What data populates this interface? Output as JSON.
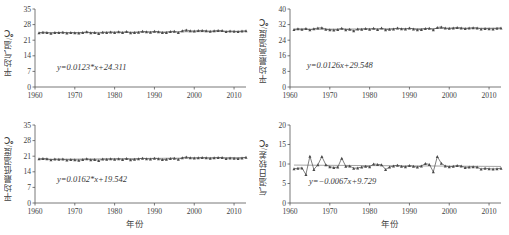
{
  "figure": {
    "xlabel": "年份",
    "x_tick_labels": [
      "1960",
      "1970",
      "1980",
      "1990",
      "2000",
      "2010"
    ],
    "x_ticks": [
      1960,
      1970,
      1980,
      1990,
      2000,
      2010
    ],
    "marker": "triangle",
    "line_color": "#555555",
    "marker_color": "#4a4a4a",
    "axis_color": "#555555"
  },
  "chart_data": [
    {
      "id": "mean-temperature",
      "type": "line",
      "position": "top-left",
      "title": "",
      "xlabel": "",
      "ylabel": "平均气温/℃",
      "annotation": "y=0.0123*x+24.311",
      "trend_slope": 0.0123,
      "trend_intercept": 24.311,
      "trend_significant": true,
      "xlim": [
        1960,
        2013
      ],
      "ylim": [
        0,
        35
      ],
      "yticks": [
        0,
        7,
        14,
        21,
        28,
        35
      ],
      "grid": false,
      "legend": "none",
      "x": [
        1961,
        1962,
        1963,
        1964,
        1965,
        1966,
        1967,
        1968,
        1969,
        1970,
        1971,
        1972,
        1973,
        1974,
        1975,
        1976,
        1977,
        1978,
        1979,
        1980,
        1981,
        1982,
        1983,
        1984,
        1985,
        1986,
        1987,
        1988,
        1989,
        1990,
        1991,
        1992,
        1993,
        1994,
        1995,
        1996,
        1997,
        1998,
        1999,
        2000,
        2001,
        2002,
        2003,
        2004,
        2005,
        2006,
        2007,
        2008,
        2009,
        2010,
        2011,
        2012,
        2013
      ],
      "values": [
        24.3,
        24.6,
        24.5,
        24.1,
        24.5,
        24.4,
        24.6,
        24.2,
        24.4,
        24.3,
        24.2,
        24.4,
        24.8,
        24.3,
        24.4,
        24.0,
        24.6,
        24.5,
        24.7,
        24.5,
        24.8,
        24.4,
        24.9,
        24.3,
        24.5,
        24.6,
        25.0,
        24.8,
        24.6,
        25.0,
        24.8,
        24.4,
        24.5,
        24.9,
        25.0,
        24.5,
        25.2,
        25.6,
        25.2,
        25.1,
        25.3,
        25.4,
        25.2,
        25.0,
        25.2,
        25.4,
        25.3,
        24.9,
        25.1,
        25.0,
        24.9,
        25.1,
        25.2
      ]
    },
    {
      "id": "mean-maximum-temperature",
      "type": "line",
      "position": "top-right",
      "title": "",
      "xlabel": "",
      "ylabel": "平均最高温度/℃",
      "annotation": "y=0.0126x+29.548",
      "trend_slope": 0.0126,
      "trend_intercept": 29.548,
      "trend_significant": false,
      "xlim": [
        1960,
        2013
      ],
      "ylim": [
        0,
        40
      ],
      "yticks": [
        0,
        8,
        16,
        24,
        32,
        40
      ],
      "grid": false,
      "legend": "none",
      "x": [
        1961,
        1962,
        1963,
        1964,
        1965,
        1966,
        1967,
        1968,
        1969,
        1970,
        1971,
        1972,
        1973,
        1974,
        1975,
        1976,
        1977,
        1978,
        1979,
        1980,
        1981,
        1982,
        1983,
        1984,
        1985,
        1986,
        1987,
        1988,
        1989,
        1990,
        1991,
        1992,
        1993,
        1994,
        1995,
        1996,
        1997,
        1998,
        1999,
        2000,
        2001,
        2002,
        2003,
        2004,
        2005,
        2006,
        2007,
        2008,
        2009,
        2010,
        2011,
        2012,
        2013
      ],
      "values": [
        29.5,
        29.9,
        29.6,
        30.0,
        29.3,
        29.9,
        30.2,
        30.4,
        29.6,
        29.4,
        29.2,
        29.5,
        30.1,
        29.4,
        29.6,
        28.9,
        29.7,
        29.6,
        30.0,
        29.6,
        30.1,
        29.5,
        30.2,
        29.4,
        29.6,
        29.8,
        30.2,
        29.9,
        29.7,
        30.2,
        29.8,
        29.4,
        29.5,
        30.0,
        30.1,
        29.4,
        30.5,
        30.8,
        30.2,
        30.1,
        30.3,
        30.5,
        30.3,
        30.0,
        30.2,
        30.4,
        30.3,
        29.8,
        30.0,
        29.9,
        29.8,
        30.1,
        30.2
      ]
    },
    {
      "id": "mean-minimum-temperature",
      "type": "line",
      "position": "bottom-left",
      "title": "",
      "xlabel": "年份",
      "ylabel": "平均最低温度/℃",
      "annotation": "y=0.0162*x+19.542",
      "trend_slope": 0.0162,
      "trend_intercept": 19.542,
      "trend_significant": true,
      "xlim": [
        1960,
        2013
      ],
      "ylim": [
        0,
        35
      ],
      "yticks": [
        0,
        7,
        14,
        21,
        28,
        35
      ],
      "grid": false,
      "legend": "none",
      "x": [
        1961,
        1962,
        1963,
        1964,
        1965,
        1966,
        1967,
        1968,
        1969,
        1970,
        1971,
        1972,
        1973,
        1974,
        1975,
        1976,
        1977,
        1978,
        1979,
        1980,
        1981,
        1982,
        1983,
        1984,
        1985,
        1986,
        1987,
        1988,
        1989,
        1990,
        1991,
        1992,
        1993,
        1994,
        1995,
        1996,
        1997,
        1998,
        1999,
        2000,
        2001,
        2002,
        2003,
        2004,
        2005,
        2006,
        2007,
        2008,
        2009,
        2010,
        2011,
        2012,
        2013
      ],
      "values": [
        19.8,
        20.0,
        19.9,
        19.4,
        19.7,
        19.6,
        19.7,
        19.3,
        19.5,
        19.4,
        19.2,
        19.5,
        19.8,
        19.4,
        19.5,
        19.1,
        19.7,
        19.6,
        19.8,
        19.6,
        19.9,
        19.5,
        20.0,
        19.4,
        19.6,
        19.8,
        20.1,
        19.9,
        19.7,
        20.1,
        19.9,
        19.5,
        19.6,
        20.0,
        20.1,
        19.6,
        20.3,
        20.6,
        20.3,
        20.2,
        20.3,
        20.4,
        20.3,
        20.1,
        20.3,
        20.4,
        20.4,
        20.0,
        20.2,
        20.1,
        20.0,
        20.2,
        20.5
      ]
    },
    {
      "id": "diurnal-temperature-range",
      "type": "line",
      "position": "bottom-right",
      "title": "",
      "xlabel": "年份",
      "ylabel": "气温日较差/℃",
      "annotation": "y=−0.0067x+9.729",
      "trend_slope": -0.0067,
      "trend_intercept": 9.729,
      "trend_significant": false,
      "xlim": [
        1960,
        2013
      ],
      "ylim": [
        0,
        20
      ],
      "yticks": [
        0,
        5,
        10,
        15,
        20
      ],
      "grid": false,
      "legend": "none",
      "x": [
        1961,
        1962,
        1963,
        1964,
        1965,
        1966,
        1967,
        1968,
        1969,
        1970,
        1971,
        1972,
        1973,
        1974,
        1975,
        1976,
        1977,
        1978,
        1979,
        1980,
        1981,
        1982,
        1983,
        1984,
        1985,
        1986,
        1987,
        1988,
        1989,
        1990,
        1991,
        1992,
        1993,
        1994,
        1995,
        1996,
        1997,
        1998,
        1999,
        2000,
        2001,
        2002,
        2003,
        2004,
        2005,
        2006,
        2007,
        2008,
        2009,
        2010,
        2011,
        2012,
        2013
      ],
      "values": [
        8.8,
        8.9,
        9.0,
        7.3,
        12.0,
        8.6,
        9.8,
        11.9,
        9.8,
        9.3,
        9.1,
        9.2,
        11.5,
        9.4,
        9.5,
        8.9,
        9.0,
        9.2,
        9.4,
        9.3,
        10.0,
        9.9,
        9.8,
        8.6,
        9.2,
        9.5,
        9.7,
        9.4,
        9.3,
        9.6,
        9.4,
        9.2,
        9.5,
        10.1,
        9.9,
        8.0,
        11.9,
        10.2,
        9.5,
        9.3,
        9.4,
        9.6,
        9.5,
        9.1,
        9.2,
        9.3,
        9.2,
        8.7,
        8.9,
        8.8,
        8.7,
        8.8,
        8.9
      ]
    }
  ]
}
